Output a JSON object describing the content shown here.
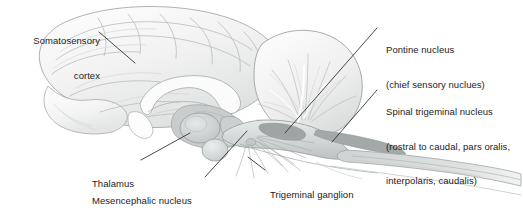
{
  "figure": {
    "type": "anatomical-diagram",
    "background_color": "#ffffff",
    "text_color": "#1c1c1c",
    "leader_line_color": "#2b2b2b"
  },
  "labels": {
    "somatosensory_cortex": {
      "line1": "Somatosensory",
      "line2": "cortex"
    },
    "pontine_nucleus": {
      "line1": "Pontine nucleus",
      "line2": "(chief sensory nuclues)"
    },
    "spinal_trigeminal_nucleus": {
      "line1": "Spinal trigeminal nucleus",
      "line2": "(rostral to caudal, pars oralis,",
      "line3": "interpolaris, caudalis)"
    },
    "thalamus": {
      "line1": "Thalamus"
    },
    "mesencephalic_nucleus": {
      "line1": "Mesencephalic nucleus"
    },
    "trigeminal_ganglion": {
      "line1": "Trigeminal ganglion"
    }
  },
  "structures": {
    "cerebrum": "cerebrum",
    "cerebellum": "cerebellum",
    "brainstem": "brainstem",
    "spinal_cord": "spinal-cord",
    "thalamus": "thalamus",
    "trigeminal_fibers": "trigeminal-nerve-fibers"
  },
  "palette": {
    "lightest": "#fbfbfb",
    "light": "#f0f0f0",
    "mid_light": "#e2e3e3",
    "mid": "#d2d4d4",
    "mid_dark": "#c0c3c3",
    "dark": "#a9adad",
    "darkest": "#8d9292",
    "outline": "#8e9393"
  }
}
